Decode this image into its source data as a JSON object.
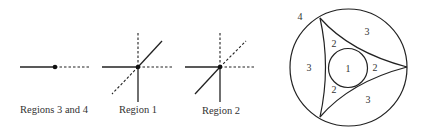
{
  "figures": [
    {
      "caption": "Regions 3 and 4",
      "center": [
        55,
        67
      ],
      "solid_segments": [
        [
          20,
          67,
          55,
          67
        ]
      ],
      "dashed_segments": [
        [
          55,
          67,
          91,
          67
        ]
      ]
    },
    {
      "caption": "Region 1",
      "center": [
        138,
        67
      ],
      "solid_segments": [
        [
          102,
          67,
          138,
          67
        ],
        [
          138,
          67,
          138,
          102
        ],
        [
          138,
          67,
          162,
          41
        ]
      ],
      "dashed_segments": [
        [
          138,
          67,
          138,
          32
        ],
        [
          138,
          67,
          174,
          67
        ],
        [
          138,
          67,
          112,
          94
        ]
      ]
    },
    {
      "caption": "Region 2",
      "center": [
        220,
        67
      ],
      "solid_segments": [
        [
          185,
          67,
          220,
          67
        ],
        [
          220,
          67,
          220,
          102
        ],
        [
          220,
          67,
          195,
          94
        ]
      ],
      "dashed_segments": [
        [
          220,
          67,
          220,
          32
        ],
        [
          220,
          67,
          256,
          67
        ],
        [
          220,
          67,
          246,
          41
        ]
      ]
    }
  ],
  "region_diagram": {
    "outer_circle": {
      "cx": 348.5,
      "cy": 67.5,
      "r": 58.5
    },
    "inner_circle": {
      "cx": 348,
      "cy": 68,
      "r": 19.5
    },
    "vertices": [
      [
        320,
        18
      ],
      [
        407,
        67
      ],
      [
        320,
        117
      ]
    ],
    "labels": [
      {
        "text": "4",
        "x": 300,
        "y": 20
      },
      {
        "text": "3",
        "x": 309,
        "y": 71
      },
      {
        "text": "3",
        "x": 367,
        "y": 35
      },
      {
        "text": "3",
        "x": 368,
        "y": 103
      },
      {
        "text": "2",
        "x": 334,
        "y": 47
      },
      {
        "text": "2",
        "x": 334,
        "y": 93
      },
      {
        "text": "2",
        "x": 375,
        "y": 71
      },
      {
        "text": "1",
        "x": 348,
        "y": 72
      }
    ]
  },
  "colors": {
    "line": "#222222",
    "text": "#333333"
  }
}
